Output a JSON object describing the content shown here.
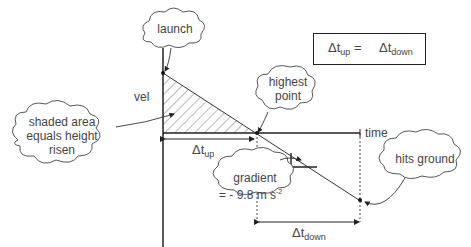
{
  "diagram": {
    "axes": {
      "y_label": "vel",
      "x_label": "time"
    },
    "callouts": {
      "launch": "launch",
      "highest_point_1": "highest",
      "highest_point_2": "point",
      "shaded_1": "shaded area",
      "shaded_2": "equals height",
      "shaded_3": "risen",
      "gradient_1": "gradient",
      "gradient_2": "= - 9.8 m s",
      "gradient_exp": "-2",
      "hits_ground": "hits ground"
    },
    "intervals": {
      "up_delta": "Δt",
      "up_sub": "up",
      "down_delta": "Δt",
      "down_sub": "down"
    },
    "equation": {
      "left": "Δt",
      "left_sub": "up",
      "equals": "=",
      "right": "Δt",
      "right_sub": "down"
    }
  }
}
